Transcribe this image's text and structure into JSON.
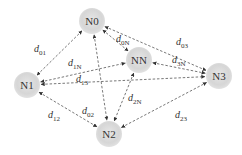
{
  "diagram": {
    "nodes": [
      {
        "id": "N0",
        "label": "N0"
      },
      {
        "id": "NN",
        "label": "NN"
      },
      {
        "id": "N3",
        "label": "N3"
      },
      {
        "id": "N1",
        "label": "N1"
      },
      {
        "id": "N2",
        "label": "N2"
      }
    ],
    "edges": [
      {
        "from": "N0",
        "to": "N1",
        "label_main": "d",
        "label_sub": "01"
      },
      {
        "from": "N0",
        "to": "NN",
        "label_main": "d",
        "label_sub": "0N"
      },
      {
        "from": "N0",
        "to": "N3",
        "label_main": "d",
        "label_sub": "03"
      },
      {
        "from": "N0",
        "to": "N2",
        "label_main": "d",
        "label_sub": "02"
      },
      {
        "from": "N1",
        "to": "NN",
        "label_main": "d",
        "label_sub": "1N"
      },
      {
        "from": "N1",
        "to": "N3",
        "label_main": "d",
        "label_sub": "13"
      },
      {
        "from": "N1",
        "to": "N2",
        "label_main": "d",
        "label_sub": "12"
      },
      {
        "from": "NN",
        "to": "N3",
        "label_main": "d",
        "label_sub": "3N"
      },
      {
        "from": "NN",
        "to": "N2",
        "label_main": "d",
        "label_sub": "2N"
      },
      {
        "from": "N2",
        "to": "N3",
        "label_main": "d",
        "label_sub": "23"
      }
    ],
    "edge_style": "dashed bidirectional arrows",
    "node_color": "#d8d8d8"
  }
}
